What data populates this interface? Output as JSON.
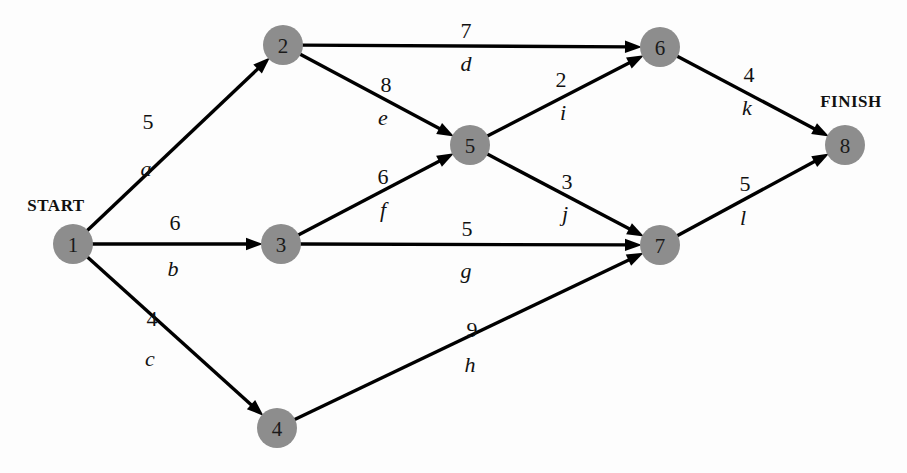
{
  "diagram": {
    "type": "activity-on-arc-network",
    "title": "",
    "width": 907,
    "height": 473,
    "node_radius": 20,
    "node_fill": "#8d8d8d",
    "edge_color": "#000000",
    "background": "#fdfdfd"
  },
  "terminals": [
    {
      "id": "start-label",
      "text": "START",
      "x": 56,
      "y": 205
    },
    {
      "id": "finish-label",
      "text": "FINISH",
      "x": 851,
      "y": 101
    }
  ],
  "nodes": [
    {
      "id": "1",
      "label": "1",
      "x": 73,
      "y": 244
    },
    {
      "id": "2",
      "label": "2",
      "x": 283,
      "y": 45
    },
    {
      "id": "3",
      "label": "3",
      "x": 281,
      "y": 244
    },
    {
      "id": "4",
      "label": "4",
      "x": 277,
      "y": 428
    },
    {
      "id": "5",
      "label": "5",
      "x": 470,
      "y": 145
    },
    {
      "id": "6",
      "label": "6",
      "x": 660,
      "y": 47
    },
    {
      "id": "7",
      "label": "7",
      "x": 660,
      "y": 245
    },
    {
      "id": "8",
      "label": "8",
      "x": 845,
      "y": 145
    }
  ],
  "edges": [
    {
      "id": "a",
      "name": "a",
      "weight": "5",
      "from": "1",
      "to": "2",
      "weight_x": 148,
      "weight_y": 121,
      "name_x": 146,
      "name_y": 168
    },
    {
      "id": "b",
      "name": "b",
      "weight": "6",
      "from": "1",
      "to": "3",
      "weight_x": 175,
      "weight_y": 222,
      "name_x": 173,
      "name_y": 268
    },
    {
      "id": "c",
      "name": "c",
      "weight": "4",
      "from": "1",
      "to": "4",
      "weight_x": 152,
      "weight_y": 318,
      "name_x": 150,
      "name_y": 358
    },
    {
      "id": "d",
      "name": "d",
      "weight": "7",
      "from": "2",
      "to": "6",
      "weight_x": 466,
      "weight_y": 30,
      "name_x": 466,
      "name_y": 63
    },
    {
      "id": "e",
      "name": "e",
      "weight": "8",
      "from": "2",
      "to": "5",
      "weight_x": 386,
      "weight_y": 84,
      "name_x": 383,
      "name_y": 117
    },
    {
      "id": "f",
      "name": "f",
      "weight": "6",
      "from": "3",
      "to": "5",
      "weight_x": 383,
      "weight_y": 176,
      "name_x": 383,
      "name_y": 209
    },
    {
      "id": "g",
      "name": "g",
      "weight": "5",
      "from": "3",
      "to": "7",
      "weight_x": 467,
      "weight_y": 228,
      "name_x": 466,
      "name_y": 270
    },
    {
      "id": "h",
      "name": "h",
      "weight": "9",
      "from": "4",
      "to": "7",
      "weight_x": 472,
      "weight_y": 329,
      "name_x": 470,
      "name_y": 364
    },
    {
      "id": "i",
      "name": "i",
      "weight": "2",
      "from": "5",
      "to": "6",
      "weight_x": 561,
      "weight_y": 79,
      "name_x": 563,
      "name_y": 112
    },
    {
      "id": "j",
      "name": "j",
      "weight": "3",
      "from": "5",
      "to": "7",
      "weight_x": 567,
      "weight_y": 181,
      "name_x": 565,
      "name_y": 213
    },
    {
      "id": "k",
      "name": "k",
      "weight": "4",
      "from": "6",
      "to": "8",
      "weight_x": 749,
      "weight_y": 74,
      "name_x": 747,
      "name_y": 107
    },
    {
      "id": "l",
      "name": "l",
      "weight": "5",
      "from": "7",
      "to": "8",
      "weight_x": 745,
      "weight_y": 183,
      "name_x": 743,
      "name_y": 217
    }
  ]
}
